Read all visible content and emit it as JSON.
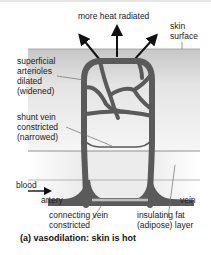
{
  "labels": {
    "heat": "more heat radiated",
    "skin_surface": [
      "skin",
      "surface"
    ],
    "arterioles": [
      "superficial",
      "arterioles",
      "dilated",
      "(widened)"
    ],
    "shunt": [
      "shunt vein",
      "constricted",
      "(narrowed)"
    ],
    "blood": "blood",
    "artery": "artery",
    "vein": "vein",
    "connecting": [
      "connecting vein",
      "constricted"
    ],
    "fat": [
      "insulating fat",
      "(adipose) layer"
    ]
  },
  "caption": "(a) vasodilation: skin is hot",
  "colors": {
    "vessel": "#5a5a5a",
    "skin_band_top": "#c8c8c8",
    "skin_band_bottom": "#f4f4f4",
    "fat_band": "#ececec",
    "line": "#6e6e6e",
    "arrow": "#111111"
  }
}
